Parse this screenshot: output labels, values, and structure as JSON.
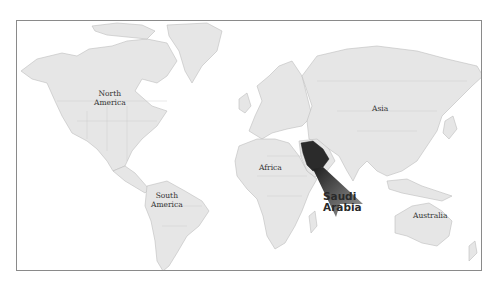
{
  "map": {
    "type": "world-locator-map",
    "highlighted_country": "Saudi Arabia",
    "colors": {
      "land": "#e6e6e6",
      "land_border": "#bdbdbd",
      "highlight": "#2b2b2b",
      "ocean": "#ffffff",
      "frame": "#8a8a8a"
    },
    "labels": {
      "north_america": "North America",
      "north_america_l1": "North",
      "north_america_l2": "America",
      "south_america_l1": "South",
      "south_america_l2": "America",
      "africa": "Africa",
      "asia": "Asia",
      "australia": "Australia",
      "callout_l1": "Saudi",
      "callout_l2": "Arabia"
    }
  }
}
